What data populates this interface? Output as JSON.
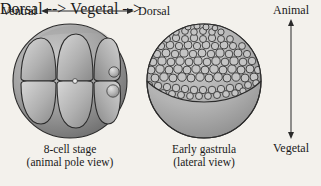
{
  "figure": {
    "background_color": "#f3f1ec",
    "ink_color": "#2a2a2a"
  },
  "axes": {
    "horizontal": {
      "name": "ventral-dorsal-axis",
      "left_label": "Ventral",
      "right_label": "Dorsal",
      "arrow": "double-headed-horizontal"
    },
    "vertical": {
      "name": "animal-vegetal-axis",
      "top_label": "Animal",
      "bottom_label": "Vegetal",
      "arrow": "double-headed-vertical"
    }
  },
  "panels": [
    {
      "id": "eight-cell-stage",
      "caption_line1": "8-cell stage",
      "caption_line2": "(animal pole view)",
      "icon": "eight-cell-embryo-diagram",
      "cell_rows": 2,
      "cells_per_row": 4,
      "small_blastomeres": 2,
      "sphere_fill": "#9d9d9d",
      "cell_fill": "#b8b8b8",
      "outline_color": "#2b2b2b"
    },
    {
      "id": "early-gastrula",
      "caption_line1": "Early gastrula",
      "caption_line2": "(lateral view)",
      "icon": "early-gastrula-embryo-diagram",
      "animal_cap_cells": "many small polygonal cells",
      "vegetal_region": "smooth unpigmented hemisphere",
      "sphere_fill": "#b5b5b5",
      "cell_fill": "#c9c9c9",
      "outline_color": "#2b2b2b"
    }
  ]
}
